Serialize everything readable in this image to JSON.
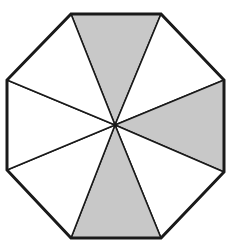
{
  "figure": {
    "title": "",
    "shape": "regular octagon divided into 8 triangles from center",
    "total_parts": 8,
    "shaded_parts": 3,
    "colors": {
      "background": "#ffffff",
      "stroke": "#1a1a1a",
      "shaded_fill": "#c8c8c8",
      "unshaded_fill": "#ffffff"
    },
    "center": [
      115,
      125
    ],
    "vertices": [
      [
        71,
        14
      ],
      [
        161,
        14
      ],
      [
        224,
        80
      ],
      [
        224,
        172
      ],
      [
        161,
        238
      ],
      [
        71,
        238
      ],
      [
        7,
        170
      ],
      [
        7,
        80
      ]
    ],
    "sectors": [
      {
        "name": "top",
        "from": 0,
        "to": 1,
        "shaded": true
      },
      {
        "name": "upper-right",
        "from": 1,
        "to": 2,
        "shaded": false
      },
      {
        "name": "right",
        "from": 2,
        "to": 3,
        "shaded": true
      },
      {
        "name": "lower-right",
        "from": 3,
        "to": 4,
        "shaded": false
      },
      {
        "name": "bottom",
        "from": 4,
        "to": 5,
        "shaded": true
      },
      {
        "name": "lower-left",
        "from": 5,
        "to": 6,
        "shaded": false
      },
      {
        "name": "left",
        "from": 6,
        "to": 7,
        "shaded": false
      },
      {
        "name": "upper-left",
        "from": 7,
        "to": 0,
        "shaded": false
      }
    ]
  }
}
